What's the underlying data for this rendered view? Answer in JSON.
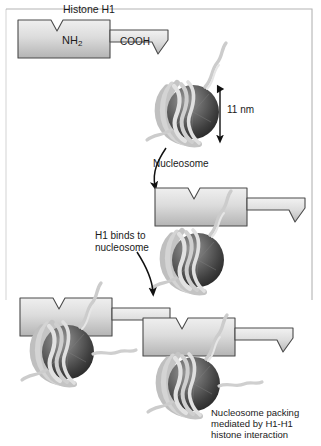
{
  "diagram": {
    "title": "Histone H1",
    "labels": {
      "nh2_prefix": "NH",
      "nh2_sub": "2",
      "cooh": "COOH",
      "size": "11 nm",
      "nucleosome": "Nucleosome",
      "h1_binds": "H1 binds to\nnucleosome",
      "packing": "Nucleosome packing\nmediated by H1-H1\nhistone interaction"
    },
    "colors": {
      "h1_fill_light": "#e8e8e8",
      "h1_fill_dark": "#b6b6b6",
      "h1_stroke": "#4a4a4a",
      "sphere_light": "#8a8a8a",
      "sphere_dark": "#2e2e2e",
      "dna": "#c9c9c9",
      "dna_stroke": "#9a9a9a",
      "text": "#1a1a1a",
      "frame": "#8c8c8c",
      "background": "#ffffff"
    }
  }
}
